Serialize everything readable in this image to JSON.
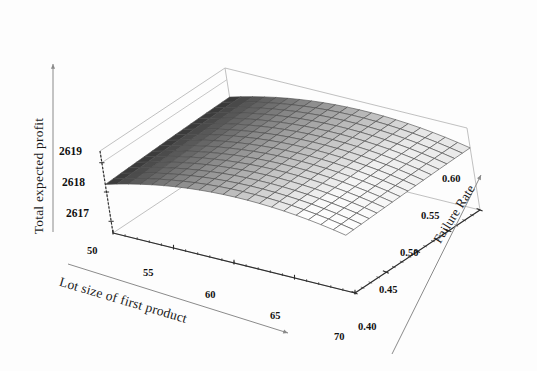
{
  "chart_data": {
    "type": "surface",
    "title": "",
    "xlabel": "Lot size of first product",
    "ylabel": "Total expected profit",
    "zlabel": "Failure Rate",
    "x_ticks": [
      "50",
      "55",
      "60",
      "65",
      "70"
    ],
    "x_values": [
      50,
      55,
      60,
      65,
      70
    ],
    "xlim": [
      50,
      70
    ],
    "z_ticks": [
      "0.40",
      "0.45",
      "0.50",
      "0.55",
      "0.60"
    ],
    "z_values": [
      0.4,
      0.45,
      0.5,
      0.55,
      0.6
    ],
    "zlim": [
      0.4,
      0.6
    ],
    "y_ticks": [
      "2617",
      "2618",
      "2619"
    ],
    "y_values": [
      2617,
      2618,
      2619
    ],
    "ylim": [
      2616.6,
      2619.4
    ],
    "grid": true,
    "legend": "none",
    "colormap": "grayscale",
    "surface_dark": "#3a3a3a",
    "surface_light": "#fbfbfb",
    "mesh_line_color": "#4a4a4a",
    "box_line_color": "#b9b9b9",
    "axis_line_color": "#8a8a8a",
    "surface_grid": {
      "x": [
        50,
        51,
        52,
        53,
        54,
        55,
        56,
        57,
        58,
        59,
        60,
        61,
        62,
        63,
        64,
        65,
        66,
        67,
        68,
        69,
        70
      ],
      "z": [
        0.4,
        0.4125,
        0.425,
        0.4375,
        0.45,
        0.4625,
        0.475,
        0.4875,
        0.5,
        0.5125,
        0.525,
        0.5375,
        0.55,
        0.5625,
        0.575,
        0.5875,
        0.6
      ],
      "y_formula": "2619.10 - 0.00525*(x-61.5)^2 - 1.30*(0.60-z)^1.35",
      "y_min": 2616.62,
      "y_max": 2619.1
    }
  },
  "axes": {
    "y_axis_title": "Total expected profit",
    "x_axis_title": "Lot size of first product",
    "z_axis_title": "Failure Rate",
    "y_tick_labels": [
      "2619",
      "2618",
      "2617"
    ],
    "x_tick_labels": [
      "50",
      "55",
      "60",
      "65",
      "70"
    ],
    "z_tick_labels": [
      "0.60",
      "0.55",
      "0.50",
      "0.45",
      "0.40"
    ]
  }
}
